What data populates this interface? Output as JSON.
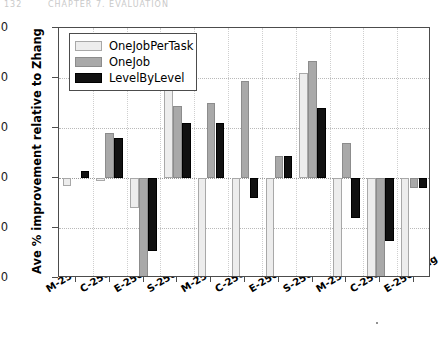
{
  "page_artifact": {
    "left_text": "132",
    "right_text": "CHAPTER 7. EVALUATION"
  },
  "chart_data": {
    "type": "bar",
    "title": "",
    "xlabel": "",
    "ylabel": "Ave % improvement relative to Zhang",
    "ylim": [
      -20,
      30
    ],
    "yticks": [
      30,
      20,
      10,
      0,
      -10,
      -20
    ],
    "ytick_labels": [
      "30",
      "20",
      "10",
      "0",
      "-10",
      "-20"
    ],
    "grid": true,
    "legend_position": "upper left",
    "categories": [
      "M-250-short",
      "C-250-short",
      "E-250-short",
      "S-250-short",
      "M-250-medium",
      "C-250-medium",
      "E-250-medium",
      "S-250-medium",
      "M-250-long",
      "C-250-long",
      "E-250-long"
    ],
    "series": [
      {
        "name": "OneJobPerTask",
        "color": "#ededed",
        "values": [
          -1.5,
          -0.6,
          -6.0,
          20.5,
          -20.0,
          -20.0,
          -20.0,
          21.0,
          -20.0,
          -20.0,
          -20.0
        ]
      },
      {
        "name": "OneJob",
        "color": "#a9a9a9",
        "values": [
          0.0,
          9.0,
          -20.0,
          14.5,
          15.0,
          19.5,
          4.5,
          23.5,
          7.0,
          -20.0,
          -2.0
        ]
      },
      {
        "name": "LevelByLevel",
        "color": "#111111",
        "values": [
          1.5,
          8.0,
          -14.5,
          11.0,
          11.0,
          -4.0,
          4.5,
          14.0,
          -8.0,
          -12.5,
          -2.0
        ]
      }
    ]
  }
}
